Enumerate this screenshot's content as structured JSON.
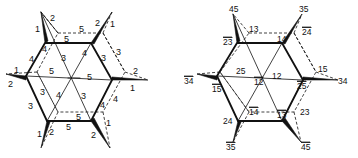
{
  "figure": {
    "left_diagram": {
      "name": "edge-labeled hexagon",
      "labels": [
        {
          "id": "l1",
          "text": "1",
          "x": 35,
          "y": 32
        },
        {
          "id": "l2",
          "text": "2",
          "x": 50,
          "y": 21
        },
        {
          "id": "l3",
          "text": "5",
          "x": 79,
          "y": 32
        },
        {
          "id": "l4",
          "text": "5",
          "x": 64,
          "y": 42
        },
        {
          "id": "l5",
          "text": "2",
          "x": 95,
          "y": 26
        },
        {
          "id": "l6",
          "text": "1",
          "x": 110,
          "y": 27
        },
        {
          "id": "l7",
          "text": "4",
          "x": 42,
          "y": 52
        },
        {
          "id": "l8",
          "text": "4",
          "x": 29,
          "y": 62
        },
        {
          "id": "l9",
          "text": "3",
          "x": 61,
          "y": 61
        },
        {
          "id": "l10",
          "text": "4",
          "x": 82,
          "y": 56
        },
        {
          "id": "l11",
          "text": "3",
          "x": 101,
          "y": 61
        },
        {
          "id": "l12",
          "text": "3",
          "x": 116,
          "y": 55
        },
        {
          "id": "l13",
          "text": "1",
          "x": 14,
          "y": 73
        },
        {
          "id": "l14",
          "text": "5",
          "x": 49,
          "y": 74
        },
        {
          "id": "l15",
          "text": "5",
          "x": 87,
          "y": 80
        },
        {
          "id": "l16",
          "text": "2",
          "x": 133,
          "y": 74
        },
        {
          "id": "l17",
          "text": "2",
          "x": 8,
          "y": 87
        },
        {
          "id": "l18",
          "text": "1",
          "x": 130,
          "y": 91
        },
        {
          "id": "l19",
          "text": "3",
          "x": 40,
          "y": 95
        },
        {
          "id": "l20",
          "text": "4",
          "x": 56,
          "y": 98
        },
        {
          "id": "l21",
          "text": "3",
          "x": 81,
          "y": 99
        },
        {
          "id": "l22",
          "text": "4",
          "x": 113,
          "y": 102
        },
        {
          "id": "l23",
          "text": "4",
          "x": 100,
          "y": 108
        },
        {
          "id": "l24",
          "text": "3",
          "x": 28,
          "y": 109
        },
        {
          "id": "l25",
          "text": "5",
          "x": 76,
          "y": 120
        },
        {
          "id": "l26",
          "text": "5",
          "x": 66,
          "y": 130
        },
        {
          "id": "l27",
          "text": "1",
          "x": 37,
          "y": 137
        },
        {
          "id": "l28",
          "text": "2",
          "x": 49,
          "y": 135
        },
        {
          "id": "l29",
          "text": "2",
          "x": 91,
          "y": 138
        },
        {
          "id": "l30",
          "text": "1",
          "x": 106,
          "y": 126
        }
      ]
    },
    "right_diagram": {
      "name": "vertex-labeled hexagon",
      "labels": [
        {
          "id": "r1",
          "text": "45",
          "overline": false,
          "x": 229,
          "y": 12
        },
        {
          "id": "r2",
          "text": "35",
          "overline": false,
          "x": 299,
          "y": 12
        },
        {
          "id": "r3",
          "text": "13",
          "overline": false,
          "x": 249,
          "y": 32
        },
        {
          "id": "r4",
          "text": "24",
          "overline": true,
          "x": 302,
          "y": 35
        },
        {
          "id": "r5",
          "text": "23",
          "overline": true,
          "x": 223,
          "y": 45
        },
        {
          "id": "r6",
          "text": "14",
          "overline": false,
          "x": 277,
          "y": 42
        },
        {
          "id": "r7",
          "text": "25",
          "overline": false,
          "x": 236,
          "y": 74
        },
        {
          "id": "r8",
          "text": "15",
          "overline": false,
          "x": 318,
          "y": 72
        },
        {
          "id": "r9",
          "text": "34",
          "overline": true,
          "x": 184,
          "y": 84
        },
        {
          "id": "r10",
          "text": "12",
          "overline": false,
          "x": 272,
          "y": 79
        },
        {
          "id": "r11",
          "text": "12",
          "overline": true,
          "x": 254,
          "y": 85
        },
        {
          "id": "r12",
          "text": "34",
          "overline": false,
          "x": 338,
          "y": 84
        },
        {
          "id": "r13",
          "text": "25",
          "overline": true,
          "x": 297,
          "y": 89
        },
        {
          "id": "r14",
          "text": "15",
          "overline": true,
          "x": 212,
          "y": 92
        },
        {
          "id": "r15",
          "text": "14",
          "overline": true,
          "x": 249,
          "y": 115
        },
        {
          "id": "r16",
          "text": "13",
          "overline": true,
          "x": 277,
          "y": 118
        },
        {
          "id": "r17",
          "text": "23",
          "overline": false,
          "x": 300,
          "y": 115
        },
        {
          "id": "r18",
          "text": "24",
          "overline": false,
          "x": 223,
          "y": 124
        },
        {
          "id": "r19",
          "text": "35",
          "overline": true,
          "x": 226,
          "y": 150
        },
        {
          "id": "r20",
          "text": "45",
          "overline": true,
          "x": 301,
          "y": 150
        }
      ]
    }
  }
}
